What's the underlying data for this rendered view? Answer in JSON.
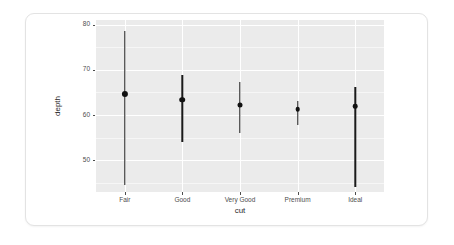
{
  "chart_data": {
    "type": "scatter",
    "plot_kind": "pointrange",
    "title": "",
    "subtitle": "",
    "xlabel": "cut",
    "ylabel": "depth",
    "categories": [
      "Fair",
      "Good",
      "Very Good",
      "Premium",
      "Ideal"
    ],
    "y_ticks": [
      50,
      60,
      70,
      80
    ],
    "y_tick_labels": [
      "50",
      "60",
      "70",
      "80"
    ],
    "ylim": [
      43.0,
      81.0
    ],
    "grid": true,
    "grid_color": "#ffffff",
    "panel_background": "#ebebeb",
    "legend": "none",
    "point_color": "#111111",
    "line_color": "#1a1a1a",
    "series": [
      {
        "name": "depth",
        "points": [
          {
            "category": "Fair",
            "value": 64.7,
            "ymin": 44.5,
            "ymax": 78.5
          },
          {
            "category": "Good",
            "value": 63.4,
            "ymin": 54.0,
            "ymax": 68.9
          },
          {
            "category": "Very Good",
            "value": 62.2,
            "ymin": 56.1,
            "ymax": 67.2
          },
          {
            "category": "Premium",
            "value": 61.3,
            "ymin": 57.8,
            "ymax": 63.0
          },
          {
            "category": "Ideal",
            "value": 61.9,
            "ymin": 44.0,
            "ymax": 66.2
          }
        ]
      }
    ]
  },
  "card": {
    "background": "#ffffff",
    "border_color": "#e3e3e3"
  }
}
